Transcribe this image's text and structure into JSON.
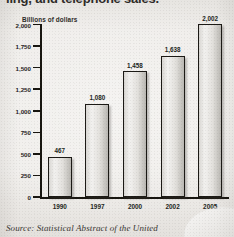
{
  "title": {
    "text": "ling, and telephone sales.",
    "clipped": true
  },
  "source": {
    "text": "Source: Statistical Abstract of the United"
  },
  "chart_data": {
    "type": "bar",
    "title": "ling, and telephone sales.",
    "xlabel": "",
    "ylabel": "Billions of dollars",
    "categories": [
      "1990",
      "1997",
      "2000",
      "2002",
      "2005"
    ],
    "values": [
      467,
      1080,
      1458,
      1638,
      2002
    ],
    "value_labels": [
      "467",
      "1,080",
      "1,458",
      "1,638",
      "2,002"
    ],
    "ylim": [
      0,
      2000
    ],
    "yticks": [
      0,
      250,
      500,
      750,
      1000,
      1250,
      1500,
      1750,
      2000
    ],
    "ytick_labels": [
      "0",
      "250",
      "500",
      "750",
      "1,000",
      "1,250",
      "1,500",
      "1,750",
      "2,000"
    ],
    "grid": false,
    "legend": "none",
    "bar_color": "#e2e0dc",
    "bar_edge_color": "#1b1915",
    "axis_color": "#17150f",
    "background": "#efedea"
  }
}
